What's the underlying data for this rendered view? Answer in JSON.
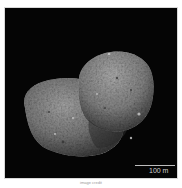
{
  "image": {
    "subject": "asteroid",
    "description": "Grayscale photograph of a two-lobed rocky asteroid against a black background",
    "background_color": "#050505",
    "surface_color": "#8a8a8a"
  },
  "scale_bar": {
    "label": "100 m"
  },
  "caption": {
    "text": "image credit"
  }
}
